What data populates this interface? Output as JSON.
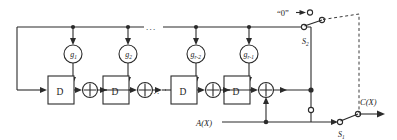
{
  "diagram": {
    "title_semantic": "linear-feedback-shift-register-encoder",
    "colors": {
      "line": "#2b2b2b",
      "text": "#1b1b1b",
      "background": "#ffffff",
      "dashed": "#3a3a3a"
    },
    "taps": [
      {
        "id": "g1",
        "base": "g",
        "subscript": "1"
      },
      {
        "id": "g2",
        "base": "g",
        "subscript": "2"
      },
      {
        "id": "gr2",
        "base": "g",
        "subscript": "r-2"
      },
      {
        "id": "gr1",
        "base": "g",
        "subscript": "r-1"
      }
    ],
    "delay_boxes": [
      {
        "id": "d1",
        "label": "D"
      },
      {
        "id": "d2",
        "label": "D"
      },
      {
        "id": "d3",
        "label": "D"
      },
      {
        "id": "d4",
        "label": "D"
      }
    ],
    "xor_gates": [
      {
        "id": "xor1"
      },
      {
        "id": "xor2"
      },
      {
        "id": "xor3"
      },
      {
        "id": "xor4"
      }
    ],
    "ellipses": [
      {
        "id": "top-ellipsis",
        "text": "..."
      },
      {
        "id": "bottom-ellipsis",
        "text": "..."
      }
    ],
    "labels": {
      "zero_input": "“0”",
      "switch_upper": "S",
      "switch_upper_sub": "2",
      "switch_lower": "S",
      "switch_lower_sub": "1",
      "input_signal": "A(X)",
      "output_signal": "C(X)"
    }
  }
}
